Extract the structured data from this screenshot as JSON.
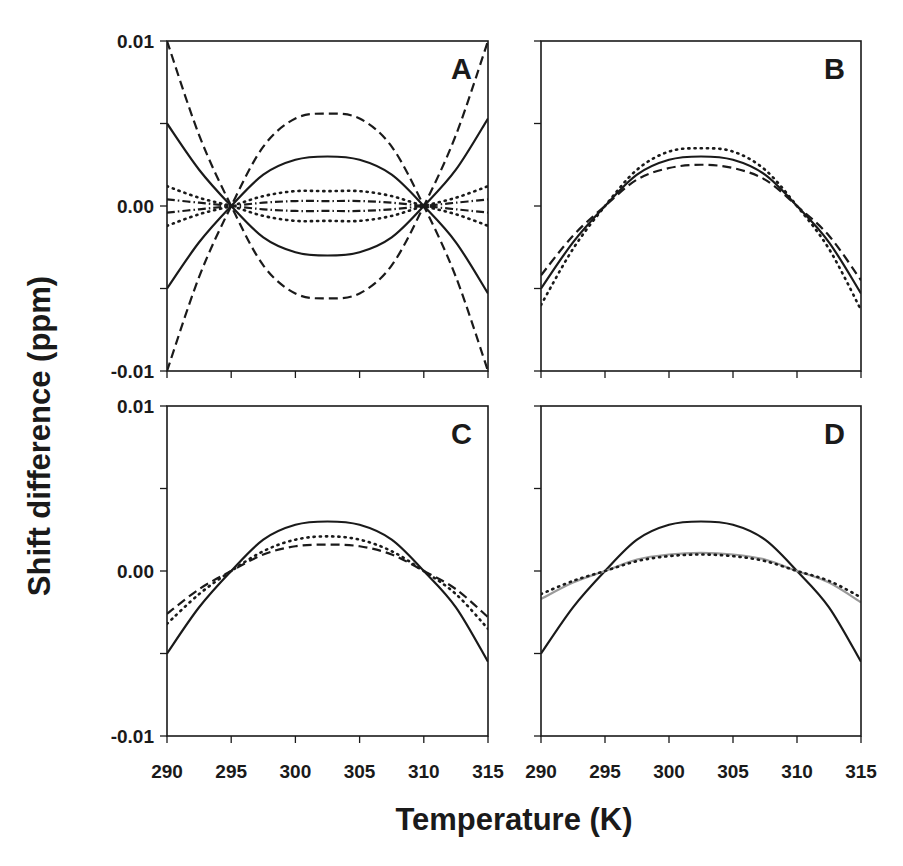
{
  "figure": {
    "ylabel": "Shift difference (ppm)",
    "xlabel": "Temperature (K)"
  },
  "chart_data": [
    {
      "panel": "A",
      "type": "line",
      "title": "A",
      "xlabel": "Temperature (K)",
      "ylabel": "Shift difference (ppm)",
      "xlim": [
        290,
        315
      ],
      "ylim": [
        -0.01,
        0.01
      ],
      "xticks": [
        290,
        295,
        300,
        305,
        310,
        315
      ],
      "yticks": [
        "-0.01",
        "0.00",
        "0.01"
      ],
      "grid": false,
      "x": [
        290,
        292.5,
        295,
        297.5,
        300,
        302.5,
        305,
        307.5,
        310,
        312.5,
        315
      ],
      "series": [
        {
          "name": "dashed (+)",
          "style": "dashed",
          "color": "#1a1a1a",
          "values": [
            -0.01,
            -0.0043,
            0.0,
            0.0036,
            0.0053,
            0.0056,
            0.0053,
            0.0036,
            0.0,
            -0.0043,
            -0.01
          ]
        },
        {
          "name": "dashed (-)",
          "style": "dashed",
          "color": "#1a1a1a",
          "values": [
            0.01,
            0.0043,
            0.0,
            -0.0036,
            -0.0053,
            -0.0056,
            -0.0053,
            -0.0036,
            0.0,
            0.0043,
            0.01
          ]
        },
        {
          "name": "solid (+)",
          "style": "solid",
          "color": "#1a1a1a",
          "values": [
            -0.005,
            -0.0022,
            0.0,
            0.0019,
            0.0028,
            0.003,
            0.0028,
            0.0019,
            0.0,
            -0.0022,
            -0.0053
          ]
        },
        {
          "name": "solid (-)",
          "style": "solid",
          "color": "#1a1a1a",
          "values": [
            0.005,
            0.0022,
            0.0,
            -0.0019,
            -0.0028,
            -0.003,
            -0.0028,
            -0.0019,
            0.0,
            0.0022,
            0.0053
          ]
        },
        {
          "name": "dotted (+)",
          "style": "dotted",
          "color": "#1a1a1a",
          "values": [
            -0.0012,
            -0.0005,
            0.0,
            0.0006,
            0.0009,
            0.0009,
            0.0009,
            0.0006,
            0.0,
            -0.0005,
            -0.0012
          ]
        },
        {
          "name": "dotted (-)",
          "style": "dotted",
          "color": "#1a1a1a",
          "values": [
            0.0012,
            0.0005,
            0.0,
            -0.0006,
            -0.0009,
            -0.0009,
            -0.0009,
            -0.0006,
            0.0,
            0.0005,
            0.0012
          ]
        },
        {
          "name": "dash-dot (+)",
          "style": "dashdot",
          "color": "#1a1a1a",
          "values": [
            -0.0004,
            -0.0002,
            0.0,
            0.0002,
            0.0003,
            0.0003,
            0.0003,
            0.0002,
            0.0,
            -0.0002,
            -0.0004
          ]
        },
        {
          "name": "dash-dot (-)",
          "style": "dashdot",
          "color": "#1a1a1a",
          "values": [
            0.0004,
            0.0002,
            0.0,
            -0.0002,
            -0.0003,
            -0.0003,
            -0.0003,
            -0.0002,
            0.0,
            0.0002,
            0.0004
          ]
        }
      ]
    },
    {
      "panel": "B",
      "type": "line",
      "title": "B",
      "xlim": [
        290,
        315
      ],
      "ylim": [
        -0.01,
        0.01
      ],
      "xticks": [
        290,
        295,
        300,
        305,
        310,
        315
      ],
      "yticks": [
        "-0.01",
        "0.00",
        "0.01"
      ],
      "grid": false,
      "x": [
        290,
        292.5,
        295,
        297.5,
        300,
        302.5,
        305,
        307.5,
        310,
        312.5,
        315
      ],
      "series": [
        {
          "name": "solid",
          "style": "solid",
          "color": "#1a1a1a",
          "values": [
            -0.005,
            -0.0022,
            0.0,
            0.0019,
            0.0028,
            0.003,
            0.0028,
            0.0019,
            0.0,
            -0.0022,
            -0.0053
          ]
        },
        {
          "name": "dotted",
          "style": "dotted",
          "color": "#1a1a1a",
          "values": [
            -0.006,
            -0.0026,
            0.0,
            0.0022,
            0.0033,
            0.0035,
            0.0033,
            0.0022,
            0.0,
            -0.0026,
            -0.0063
          ]
        },
        {
          "name": "dashed",
          "style": "dashed",
          "color": "#1a1a1a",
          "values": [
            -0.0042,
            -0.0018,
            0.0,
            0.0016,
            0.0023,
            0.0025,
            0.0023,
            0.0016,
            0.0,
            -0.0018,
            -0.0045
          ]
        }
      ]
    },
    {
      "panel": "C",
      "type": "line",
      "title": "C",
      "xlim": [
        290,
        315
      ],
      "ylim": [
        -0.01,
        0.01
      ],
      "xticks": [
        290,
        295,
        300,
        305,
        310,
        315
      ],
      "xticklabels": [
        "290",
        "295",
        "300",
        "305",
        "310",
        "315"
      ],
      "yticks": [
        "-0.01",
        "0.00",
        "0.01"
      ],
      "grid": false,
      "x": [
        290,
        292.5,
        295,
        297.5,
        300,
        302.5,
        305,
        307.5,
        310,
        312.5,
        315
      ],
      "series": [
        {
          "name": "solid",
          "style": "solid",
          "color": "#1a1a1a",
          "values": [
            -0.005,
            -0.0022,
            0.0,
            0.0019,
            0.0028,
            0.003,
            0.0028,
            0.0019,
            0.0,
            -0.0022,
            -0.0055
          ]
        },
        {
          "name": "dotted",
          "style": "dotted",
          "color": "#1a1a1a",
          "values": [
            -0.0032,
            -0.0014,
            0.0,
            0.0012,
            0.0019,
            0.0021,
            0.0019,
            0.0012,
            0.0,
            -0.0014,
            -0.0035
          ]
        },
        {
          "name": "dashed",
          "style": "dashed",
          "color": "#1a1a1a",
          "values": [
            -0.0026,
            -0.0011,
            0.0,
            0.001,
            0.0015,
            0.0016,
            0.0015,
            0.001,
            0.0,
            -0.0011,
            -0.0028
          ]
        }
      ]
    },
    {
      "panel": "D",
      "type": "line",
      "title": "D",
      "xlim": [
        290,
        315
      ],
      "ylim": [
        -0.01,
        0.01
      ],
      "xticks": [
        290,
        295,
        300,
        305,
        310,
        315
      ],
      "xticklabels": [
        "290",
        "295",
        "300",
        "305",
        "310",
        "315"
      ],
      "yticks": [
        "-0.01",
        "0.00",
        "0.01"
      ],
      "grid": false,
      "x": [
        290,
        292.5,
        295,
        297.5,
        300,
        302.5,
        305,
        307.5,
        310,
        312.5,
        315
      ],
      "series": [
        {
          "name": "solid",
          "style": "solid",
          "color": "#1a1a1a",
          "values": [
            -0.005,
            -0.0022,
            0.0,
            0.0019,
            0.0028,
            0.003,
            0.0028,
            0.0019,
            0.0,
            -0.0022,
            -0.0055
          ]
        },
        {
          "name": "gray solid",
          "style": "solid",
          "color": "#9a9a9a",
          "values": [
            -0.0017,
            -0.0007,
            0.0,
            0.0007,
            0.001,
            0.0011,
            0.001,
            0.0007,
            0.0,
            -0.0007,
            -0.0019
          ]
        },
        {
          "name": "dotted",
          "style": "dotted",
          "color": "#1a1a1a",
          "values": [
            -0.0014,
            -0.0006,
            0.0,
            0.0006,
            0.0009,
            0.001,
            0.0009,
            0.0006,
            0.0,
            -0.0006,
            -0.0016
          ]
        }
      ]
    }
  ]
}
